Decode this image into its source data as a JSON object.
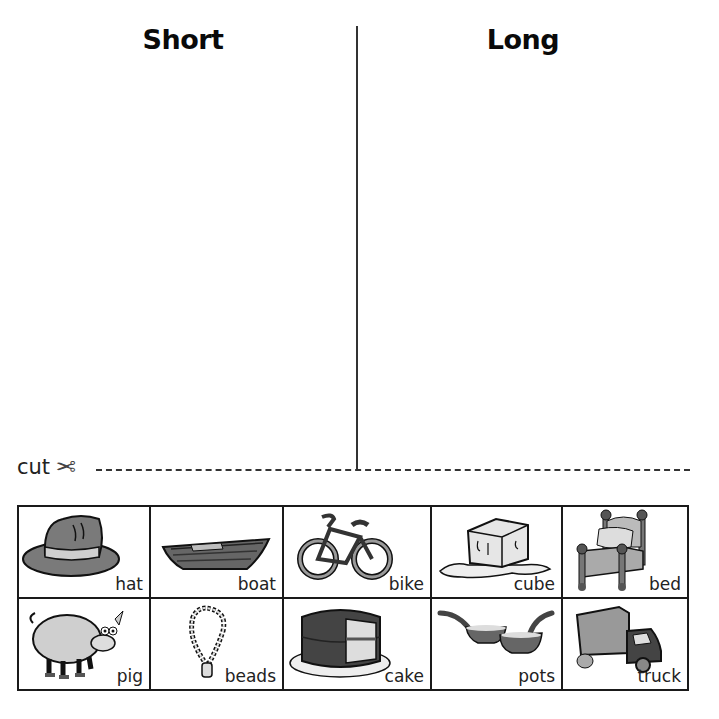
{
  "worksheet": {
    "columns": [
      {
        "heading": "Short"
      },
      {
        "heading": "Long"
      }
    ],
    "cut_label": "cut",
    "scissors_icon": "✂",
    "cards": [
      {
        "word": "hat",
        "icon": "hat-icon"
      },
      {
        "word": "boat",
        "icon": "boat-icon"
      },
      {
        "word": "bike",
        "icon": "bike-icon"
      },
      {
        "word": "cube",
        "icon": "ice-cube-icon"
      },
      {
        "word": "bed",
        "icon": "bed-icon"
      },
      {
        "word": "pig",
        "icon": "pig-icon"
      },
      {
        "word": "beads",
        "icon": "beads-icon"
      },
      {
        "word": "cake",
        "icon": "cake-icon"
      },
      {
        "word": "pots",
        "icon": "pots-icon"
      },
      {
        "word": "truck",
        "icon": "truck-icon"
      }
    ]
  },
  "colors": {
    "ink": "#1a1a1a",
    "fill_dark": "#555555",
    "fill_mid": "#8a8a8a",
    "fill_light": "#c8c8c8"
  }
}
